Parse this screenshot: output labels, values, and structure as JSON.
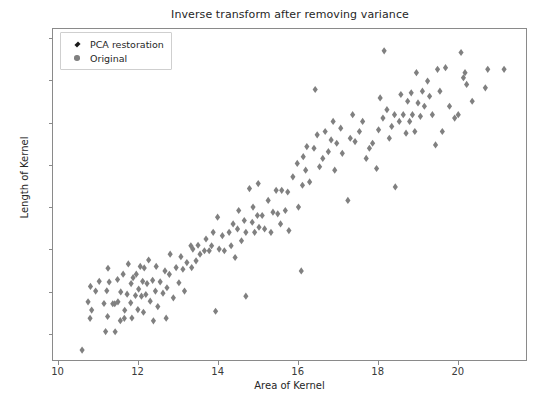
{
  "chart_data": {
    "type": "scatter",
    "title": "Inverse transform after removing variance",
    "xlabel": "Area of Kernel",
    "ylabel": "Length of Kernel",
    "xlim": [
      9.86,
      21.73
    ],
    "ylim": [
      4.84,
      6.81
    ],
    "xticks": [
      10,
      12,
      14,
      16,
      18,
      20
    ],
    "xtick_labels": [
      "10",
      "12",
      "14",
      "16",
      "18",
      "20"
    ],
    "yticks": [
      5.0,
      5.25,
      5.5,
      5.75,
      6.0,
      6.25,
      6.5,
      6.75
    ],
    "ytick_labels": [
      "5.00",
      "5.25",
      "5.50",
      "5.75",
      "6.00",
      "6.25",
      "6.50",
      "6.75"
    ],
    "grid": false,
    "legend_position": "upper left",
    "series": [
      {
        "name": "PCA restoration",
        "marker": "diamond",
        "color": "#000000",
        "points": []
      },
      {
        "name": "Original",
        "marker": "circle",
        "color": "#808080",
        "points": [
          [
            10.59,
            4.899
          ],
          [
            10.74,
            5.186
          ],
          [
            10.79,
            5.088
          ],
          [
            10.83,
            5.137
          ],
          [
            10.8,
            5.278
          ],
          [
            10.93,
            5.25
          ],
          [
            11.02,
            5.308
          ],
          [
            11.14,
            5.176
          ],
          [
            11.18,
            5.009
          ],
          [
            11.23,
            5.099
          ],
          [
            11.21,
            5.252
          ],
          [
            11.24,
            5.386
          ],
          [
            11.27,
            5.304
          ],
          [
            11.36,
            5.175
          ],
          [
            11.41,
            5.175
          ],
          [
            11.42,
            5.008
          ],
          [
            11.48,
            5.319
          ],
          [
            11.49,
            5.186
          ],
          [
            11.55,
            5.074
          ],
          [
            11.56,
            5.245
          ],
          [
            11.62,
            5.351
          ],
          [
            11.65,
            5.088
          ],
          [
            11.66,
            5.136
          ],
          [
            11.72,
            5.232
          ],
          [
            11.75,
            5.412
          ],
          [
            11.81,
            5.18
          ],
          [
            11.82,
            5.295
          ],
          [
            11.84,
            5.09
          ],
          [
            11.87,
            5.33
          ],
          [
            11.93,
            5.224
          ],
          [
            11.95,
            5.351
          ],
          [
            11.99,
            5.14
          ],
          [
            12.01,
            5.262
          ],
          [
            12.05,
            5.397
          ],
          [
            12.08,
            5.22
          ],
          [
            12.11,
            5.308
          ],
          [
            12.13,
            5.124
          ],
          [
            12.15,
            5.388
          ],
          [
            12.19,
            5.23
          ],
          [
            12.22,
            5.295
          ],
          [
            12.26,
            5.435
          ],
          [
            12.3,
            5.19
          ],
          [
            12.36,
            5.314
          ],
          [
            12.38,
            5.073
          ],
          [
            12.43,
            5.25
          ],
          [
            12.45,
            5.397
          ],
          [
            12.49,
            5.158
          ],
          [
            12.55,
            5.305
          ],
          [
            12.62,
            5.238
          ],
          [
            12.67,
            5.37
          ],
          [
            12.7,
            5.089
          ],
          [
            12.72,
            5.27
          ],
          [
            12.78,
            5.35
          ],
          [
            12.8,
            5.47
          ],
          [
            12.88,
            5.21
          ],
          [
            12.95,
            5.39
          ],
          [
            13.02,
            5.3
          ],
          [
            13.07,
            5.455
          ],
          [
            13.12,
            5.38
          ],
          [
            13.16,
            5.25
          ],
          [
            13.22,
            5.42
          ],
          [
            13.32,
            5.52
          ],
          [
            13.34,
            5.39
          ],
          [
            13.37,
            5.5
          ],
          [
            13.45,
            5.43
          ],
          [
            13.5,
            5.523
          ],
          [
            13.55,
            5.47
          ],
          [
            13.66,
            5.49
          ],
          [
            13.7,
            5.56
          ],
          [
            13.78,
            5.49
          ],
          [
            13.84,
            5.52
          ],
          [
            13.88,
            5.6
          ],
          [
            13.94,
            5.13
          ],
          [
            13.99,
            5.69
          ],
          [
            14.03,
            5.5
          ],
          [
            14.11,
            5.58
          ],
          [
            14.16,
            5.49
          ],
          [
            14.28,
            5.6
          ],
          [
            14.33,
            5.52
          ],
          [
            14.38,
            5.65
          ],
          [
            14.43,
            5.45
          ],
          [
            14.49,
            5.62
          ],
          [
            14.52,
            5.73
          ],
          [
            14.59,
            5.55
          ],
          [
            14.66,
            5.67
          ],
          [
            14.7,
            5.6
          ],
          [
            14.7,
            5.22
          ],
          [
            14.79,
            5.86
          ],
          [
            14.86,
            5.66
          ],
          [
            14.88,
            5.75
          ],
          [
            14.92,
            5.6
          ],
          [
            14.99,
            5.7
          ],
          [
            15.01,
            5.89
          ],
          [
            15.03,
            5.63
          ],
          [
            15.11,
            5.7
          ],
          [
            15.17,
            5.62
          ],
          [
            15.26,
            5.79
          ],
          [
            15.33,
            5.6
          ],
          [
            15.38,
            5.72
          ],
          [
            15.46,
            5.85
          ],
          [
            15.5,
            5.71
          ],
          [
            15.57,
            5.65
          ],
          [
            15.6,
            5.85
          ],
          [
            15.69,
            5.73
          ],
          [
            15.75,
            5.84
          ],
          [
            15.78,
            5.61
          ],
          [
            15.88,
            5.93
          ],
          [
            15.99,
            6.01
          ],
          [
            16.02,
            5.75
          ],
          [
            16.09,
            5.37
          ],
          [
            16.12,
            5.88
          ],
          [
            16.14,
            6.05
          ],
          [
            16.2,
            5.97
          ],
          [
            16.23,
            6.11
          ],
          [
            16.3,
            5.9
          ],
          [
            16.41,
            6.1
          ],
          [
            16.44,
            6.45
          ],
          [
            16.49,
            6.18
          ],
          [
            16.55,
            5.99
          ],
          [
            16.63,
            6.04
          ],
          [
            16.69,
            6.2
          ],
          [
            16.77,
            6.08
          ],
          [
            16.84,
            6.15
          ],
          [
            16.89,
            6.26
          ],
          [
            16.93,
            5.97
          ],
          [
            16.98,
            6.13
          ],
          [
            17.08,
            6.22
          ],
          [
            17.12,
            6.07
          ],
          [
            17.26,
            5.79
          ],
          [
            17.32,
            6.16
          ],
          [
            17.38,
            6.3
          ],
          [
            17.44,
            6.14
          ],
          [
            17.55,
            6.2
          ],
          [
            17.63,
            6.26
          ],
          [
            17.72,
            6.04
          ],
          [
            17.8,
            6.1
          ],
          [
            17.88,
            6.13
          ],
          [
            17.98,
            5.98
          ],
          [
            18.03,
            6.21
          ],
          [
            18.07,
            6.4
          ],
          [
            18.14,
            6.28
          ],
          [
            18.17,
            6.68
          ],
          [
            18.24,
            6.33
          ],
          [
            18.3,
            6.16
          ],
          [
            18.36,
            6.23
          ],
          [
            18.43,
            6.3
          ],
          [
            18.45,
            5.87
          ],
          [
            18.55,
            6.26
          ],
          [
            18.59,
            6.42
          ],
          [
            18.65,
            6.3
          ],
          [
            18.72,
            6.19
          ],
          [
            18.76,
            6.38
          ],
          [
            18.81,
            6.26
          ],
          [
            18.85,
            6.43
          ],
          [
            18.88,
            6.3
          ],
          [
            18.94,
            6.2
          ],
          [
            18.98,
            6.55
          ],
          [
            19.02,
            6.37
          ],
          [
            19.08,
            6.29
          ],
          [
            19.13,
            6.44
          ],
          [
            19.18,
            6.35
          ],
          [
            19.26,
            6.5
          ],
          [
            19.31,
            6.41
          ],
          [
            19.38,
            6.3
          ],
          [
            19.46,
            6.12
          ],
          [
            19.51,
            6.57
          ],
          [
            19.57,
            6.44
          ],
          [
            19.63,
            6.2
          ],
          [
            19.71,
            6.58
          ],
          [
            19.81,
            6.35
          ],
          [
            19.94,
            6.28
          ],
          [
            20.03,
            6.3
          ],
          [
            20.1,
            6.67
          ],
          [
            20.16,
            6.52
          ],
          [
            20.2,
            6.55
          ],
          [
            20.24,
            6.48
          ],
          [
            20.38,
            6.38
          ],
          [
            20.71,
            6.46
          ],
          [
            20.77,
            6.57
          ],
          [
            21.18,
            6.57
          ]
        ]
      }
    ]
  },
  "legend": {
    "entries": [
      {
        "label": "PCA restoration",
        "marker": "diamond",
        "color": "#1a1a1a"
      },
      {
        "label": "Original",
        "marker": "circle",
        "color": "#808080"
      }
    ]
  },
  "style": {
    "marker_color": "#808080",
    "axis_color": "#8a8a8a",
    "text_color": "#262626",
    "background": "#ffffff"
  }
}
